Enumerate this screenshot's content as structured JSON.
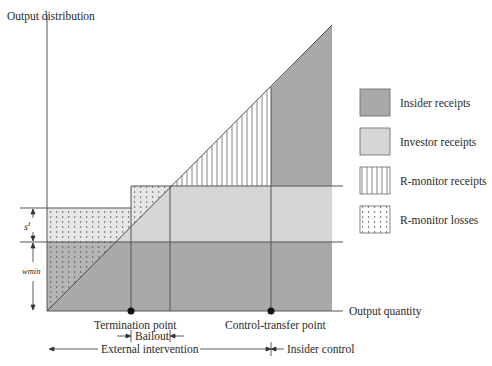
{
  "axes": {
    "y_label": "Output distribution",
    "x_label": "Output quantity"
  },
  "markers": {
    "s_label": "s",
    "s_superscript": "I",
    "wmin_label": "wmin"
  },
  "points": {
    "termination": "Termination point",
    "control_transfer": "Control-transfer point"
  },
  "regimes": {
    "bailout": "Bailout",
    "external_intervention": "External intervention",
    "insider_control": "Insider control"
  },
  "legend": [
    {
      "label": "Insider receipts",
      "fill": "#a9a9a9",
      "pattern": "solid"
    },
    {
      "label": "Investor receipts",
      "fill": "#d6d6d6",
      "pattern": "solid"
    },
    {
      "label": "R-monitor receipts",
      "fill": "#ffffff",
      "pattern": "vertical-lines"
    },
    {
      "label": "R-monitor losses",
      "fill": "#ffffff",
      "pattern": "dots"
    }
  ],
  "colors": {
    "insider": "#a9a9a9",
    "investor": "#d6d6d6",
    "line": "#555555"
  }
}
